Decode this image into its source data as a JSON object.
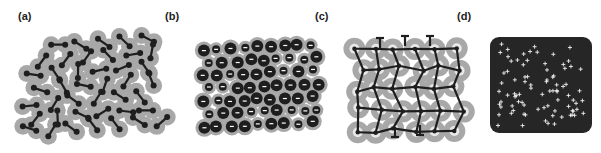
{
  "figure": {
    "panels": [
      {
        "id": "a",
        "label": "(a)",
        "description": "dumbbell-shaped molecules with grey halos, dense packing"
      },
      {
        "id": "b",
        "label": "(b)",
        "description": "circular particles of two sizes with grey halos, each with a white bar"
      },
      {
        "id": "c",
        "label": "(c)",
        "description": "branched network of dark strands with grey halo regions"
      },
      {
        "id": "d",
        "label": "(d)",
        "description": "dark rounded square with scattered white cross/plus markers"
      }
    ]
  },
  "colors": {
    "background": "#ffffff",
    "halo": "#a8a8a8",
    "core": "#1e1e1e",
    "marker": "#f0f0f0",
    "label": "#222222"
  }
}
